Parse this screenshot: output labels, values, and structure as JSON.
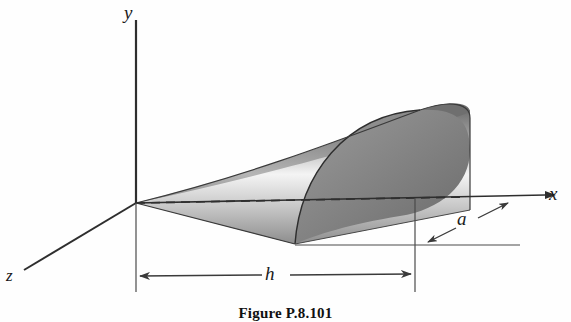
{
  "figure": {
    "caption": "Figure P.8.101",
    "axes": {
      "y_label": "y",
      "x_label": "x",
      "z_label": "z"
    },
    "dimensions": {
      "length_label": "h",
      "radius_label": "a"
    },
    "colors": {
      "line": "#3a3a3a",
      "surface_dark": "#6e6e6e",
      "surface_light": "#f2f2f2",
      "background": "#ffffff"
    },
    "icon_names": {
      "solid": "half-paraboloid-solid",
      "centerline": "dashed-centerline"
    }
  }
}
